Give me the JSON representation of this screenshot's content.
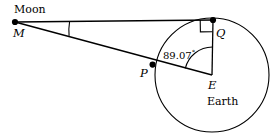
{
  "figure": {
    "type": "geometry-diagram",
    "background_color": "#ffffff",
    "stroke_color": "#000000",
    "width": 279,
    "height": 135
  },
  "labels": {
    "moon": "Moon",
    "moon_point": "M",
    "tangent_point": "Q",
    "circle_point": "P",
    "center_point": "E",
    "earth": "Earth",
    "angle_value": "89.07",
    "angle_degree_symbol": "°"
  },
  "geometry": {
    "circle": {
      "cx": 212,
      "cy": 75,
      "r": 57
    },
    "points": {
      "M": {
        "x": 15,
        "y": 22
      },
      "Q": {
        "x": 213,
        "y": 20
      },
      "P": {
        "x": 152.6,
        "y": 64.6
      },
      "E": {
        "x": 212,
        "y": 75
      }
    },
    "segments": [
      {
        "name": "MQ",
        "from": "M",
        "to": "Q"
      },
      {
        "name": "ME",
        "from": "M",
        "to": "E"
      },
      {
        "name": "QE",
        "from": "Q",
        "to": "E"
      }
    ],
    "markers": {
      "right_angle_at_Q": true,
      "angle_arc_at_E": "89.07",
      "angle_arc_at_M": true,
      "dots": [
        "M",
        "Q",
        "P"
      ]
    }
  }
}
